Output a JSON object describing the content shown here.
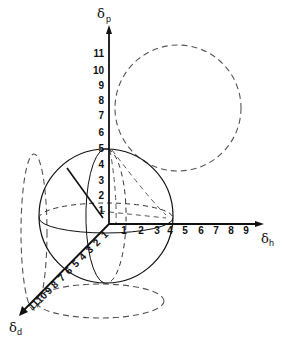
{
  "diagram": {
    "type": "3d-solubility-sphere",
    "axes": {
      "p": {
        "symbol": "δ",
        "subscript": "p",
        "ticks": [
          "1",
          "2",
          "3",
          "4",
          "5",
          "6",
          "7",
          "8",
          "9",
          "10",
          "11"
        ]
      },
      "h": {
        "symbol": "δ",
        "subscript": "h",
        "ticks": [
          "1",
          "2",
          "3",
          "4",
          "5",
          "6",
          "7",
          "8",
          "9"
        ]
      },
      "d": {
        "symbol": "δ",
        "subscript": "d",
        "ticks": [
          "1",
          "2",
          "3",
          "4",
          "5",
          "6",
          "7",
          "8",
          "9",
          "10",
          "11"
        ]
      }
    },
    "elements": [
      "solubility-sphere",
      "radius-line",
      "projection-circle-ph-plane",
      "projection-ellipse-pd-plane",
      "projection-ellipse-dh-plane"
    ],
    "colors": {
      "line": "#111111",
      "dashed": "#555555",
      "background": "#ffffff"
    }
  }
}
